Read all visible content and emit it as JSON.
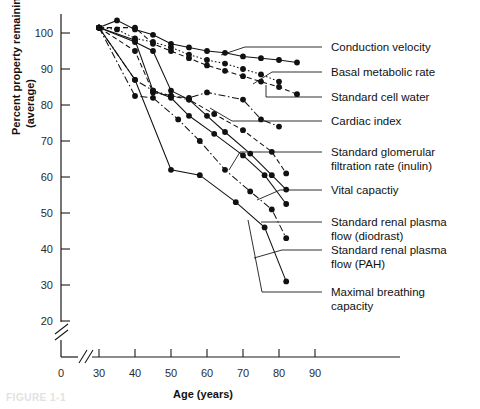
{
  "figure": {
    "caption": "FIGURE 1-1"
  },
  "chart_data": {
    "type": "line",
    "title": "",
    "xlabel": "Age (years)",
    "ylabel": "Percent property remaining (average)",
    "xlim": [
      30,
      90
    ],
    "ylim": [
      20,
      102
    ],
    "xticks": [
      0,
      30,
      40,
      50,
      60,
      70,
      80,
      90
    ],
    "yticks": [
      20,
      30,
      40,
      50,
      60,
      70,
      80,
      90,
      100
    ],
    "axis_break_x": true,
    "axis_break_y": true,
    "grid": false,
    "legend_position": "right-callout-labels",
    "marker": "filled-circle",
    "series": [
      {
        "name": "Conduction velocity",
        "style": "solid",
        "x": [
          30,
          35,
          40,
          45,
          50,
          55,
          60,
          65,
          70,
          75,
          80,
          85
        ],
        "y": [
          101.5,
          103.5,
          101,
          99.5,
          97,
          96,
          95,
          94.5,
          93.5,
          93,
          92.5,
          91.8
        ]
      },
      {
        "name": "Basal metabolic rate",
        "style": "dotted",
        "x": [
          30,
          35,
          40,
          45,
          50,
          55,
          60,
          65,
          70,
          75,
          80
        ],
        "y": [
          101.5,
          101,
          98.5,
          97.5,
          96,
          94,
          92.5,
          91.5,
          90,
          88.5,
          86.5
        ]
      },
      {
        "name": "Standard cell water",
        "style": "dashed",
        "x": [
          30,
          40,
          45,
          50,
          55,
          60,
          65,
          70,
          75,
          80,
          85
        ],
        "y": [
          101.5,
          101.5,
          97,
          95,
          93,
          91,
          89.5,
          88,
          86.5,
          85,
          83
        ]
      },
      {
        "name": "Cardiac index",
        "style": "dash-dot",
        "x": [
          30,
          40,
          45,
          50,
          55,
          60,
          70,
          75,
          80
        ],
        "y": [
          101.5,
          87,
          84,
          82.5,
          82,
          83.5,
          81.5,
          76,
          74
        ]
      },
      {
        "name": "Standard glomerular filtration rate (inulin)",
        "style": "dashed",
        "x": [
          30,
          40,
          45,
          50,
          55,
          62,
          70,
          78,
          82
        ],
        "y": [
          101.5,
          95,
          83.5,
          82.5,
          81.5,
          77.5,
          73,
          67,
          61
        ]
      },
      {
        "name": "Vital capactiy",
        "style": "solid",
        "x": [
          30,
          40,
          45,
          50,
          55,
          60,
          65,
          72,
          78,
          82
        ],
        "y": [
          101.5,
          97.5,
          95,
          84,
          81.5,
          77,
          72.5,
          66.5,
          60.5,
          56.5
        ]
      },
      {
        "name": "Standard renal plasma flow (diodrast)",
        "style": "solid",
        "x": [
          30,
          40,
          45,
          50,
          55,
          62,
          70,
          76,
          82
        ],
        "y": [
          101.5,
          98,
          84,
          82,
          77,
          72,
          66,
          60.5,
          52.5
        ]
      },
      {
        "name": "Standard renal plasma flow (PAH)",
        "style": "dash-dot",
        "x": [
          30,
          40,
          45,
          52,
          58,
          65,
          72,
          78,
          82
        ],
        "y": [
          101.5,
          82.5,
          82,
          76,
          70,
          62,
          56,
          51,
          43
        ]
      },
      {
        "name": "Maximal breathing capacity",
        "style": "solid",
        "x": [
          30,
          40,
          50,
          58,
          68,
          76,
          82
        ],
        "y": [
          101.5,
          87,
          62,
          60.5,
          53,
          46,
          31
        ]
      }
    ],
    "callouts": [
      {
        "label": "Conduction velocity",
        "anchor_x": 221,
        "anchor_y": 55,
        "text_x": 330,
        "text_y": 56
      },
      {
        "label": "Basal metabolic rate",
        "anchor_x": 253,
        "anchor_y": 84,
        "text_x": 330,
        "text_y": 82
      },
      {
        "label": "Standard cell water",
        "anchor_x": 266,
        "anchor_y": 93,
        "text_x": 330,
        "text_y": 106
      },
      {
        "label": "Cardiac index",
        "anchor_x": 244,
        "anchor_y": 112,
        "text_x": 330,
        "text_y": 130
      },
      {
        "label": "Standard glomerular",
        "label2": "filtration rate (inulin)",
        "anchor_x": 250,
        "anchor_y": 158,
        "text_x": 330,
        "text_y": 160
      },
      {
        "label": "Vital capactiy",
        "anchor_x": 272,
        "anchor_y": 196,
        "text_x": 330,
        "text_y": 196
      },
      {
        "label": "Standard renal plasma",
        "label2": "flow (diodrast)",
        "anchor_x": 290,
        "anchor_y": 221,
        "text_x": 330,
        "text_y": 228
      },
      {
        "label": "Standard renal plasma",
        "label2": "flow (PAH)",
        "anchor_x": 281,
        "anchor_y": 253,
        "text_x": 330,
        "text_y": 262
      },
      {
        "label": "Maximal breathing",
        "label2": "capacity",
        "anchor_x": 253,
        "anchor_y": 300,
        "text_x": 330,
        "text_y": 298
      }
    ]
  }
}
